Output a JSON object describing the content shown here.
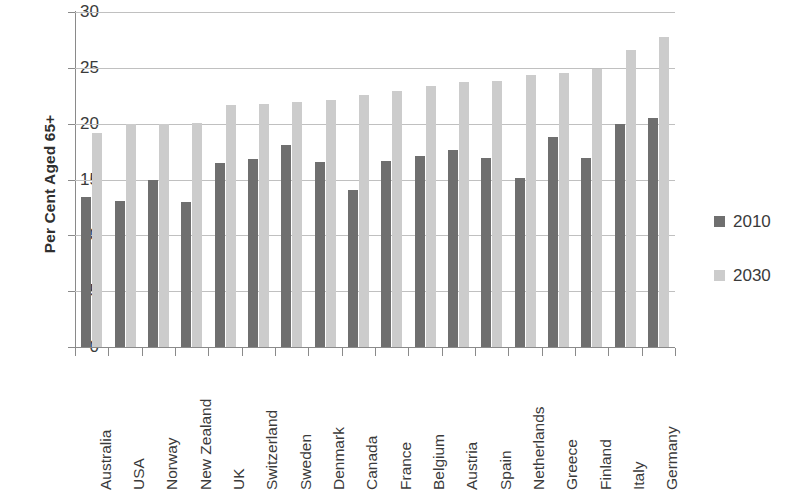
{
  "chart_data": {
    "type": "bar",
    "title": "",
    "xlabel": "",
    "ylabel": "Per Cent Aged 65+",
    "ylim": [
      0,
      30
    ],
    "ytick_step": 5,
    "yticks": [
      "30",
      "25",
      "20",
      "15",
      "10",
      "5",
      "0"
    ],
    "grid": true,
    "legend_position": "right",
    "categories": [
      "Australia",
      "USA",
      "Norway",
      "New Zealand",
      "UK",
      "Switzerland",
      "Sweden",
      "Denmark",
      "Canada",
      "France",
      "Belgium",
      "Austria",
      "Spain",
      "Netherlands",
      "Greece",
      "Finland",
      "Italy",
      "Germany"
    ],
    "series": [
      {
        "name": "2010",
        "color": "#6f6f6f",
        "values": [
          13.4,
          13.1,
          15.0,
          13.0,
          16.5,
          16.8,
          18.1,
          16.6,
          14.1,
          16.7,
          17.1,
          17.6,
          16.9,
          15.1,
          18.8,
          16.9,
          20.0,
          20.5
        ]
      },
      {
        "name": "2030",
        "color": "#cccccc",
        "values": [
          19.2,
          20.0,
          20.0,
          20.1,
          21.7,
          21.8,
          21.9,
          22.1,
          22.6,
          22.9,
          23.4,
          23.7,
          23.8,
          24.4,
          24.5,
          24.9,
          26.6,
          27.8
        ]
      }
    ]
  },
  "legend": {
    "items": [
      {
        "label": "2010",
        "color": "#6f6f6f"
      },
      {
        "label": "2030",
        "color": "#cccccc"
      }
    ]
  }
}
